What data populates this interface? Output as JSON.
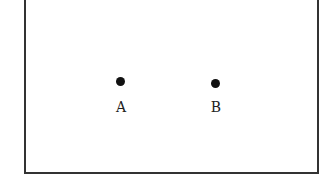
{
  "diagram": {
    "points": [
      {
        "label": "A",
        "x": 120,
        "y": 81
      },
      {
        "label": "B",
        "x": 215,
        "y": 83
      }
    ]
  }
}
